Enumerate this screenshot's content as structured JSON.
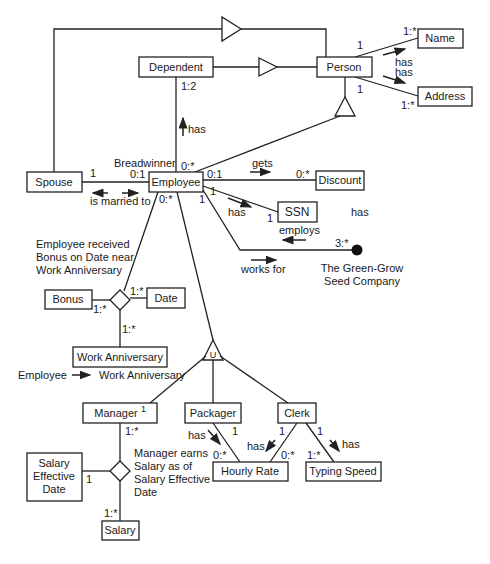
{
  "diagram": {
    "type": "entity-relationship / class diagram",
    "entities": {
      "spouse": "Spouse",
      "employee": "Employee",
      "dependent": "Dependent",
      "person": "Person",
      "name": "Name",
      "address": "Address",
      "discount": "Discount",
      "ssn": "SSN",
      "bonus": "Bonus",
      "date": "Date",
      "work_anniversary": "Work Anniversary",
      "manager": "Manager",
      "manager_sup": "1",
      "packager": "Packager",
      "clerk": "Clerk",
      "hourly_rate": "Hourly Rate",
      "typing_speed": "Typing Speed",
      "salary_effective_date": [
        "Salary",
        "Effective",
        "Date"
      ],
      "salary": "Salary"
    },
    "company": [
      "The Green-Grow",
      "Seed  Company"
    ],
    "labels": {
      "has": "has",
      "gets": "gets",
      "employs": "employs",
      "works_for": "works for",
      "is_married_to": "is married to",
      "breadwinner": "Breadwinner",
      "floating_has": "has",
      "bonus_note": [
        "Employee received",
        "Bonus on Date near",
        "Work Anniversary"
      ],
      "manager_note": [
        "Manager earns",
        "Salary as of",
        "Salary Effective",
        "Date"
      ],
      "legend_from": "Employee",
      "legend_to": "Work Anniversary",
      "union_symbol": "U"
    },
    "multiplicities": {
      "person_name_person": "1",
      "person_name_name": "1:*",
      "person_address_person": "1",
      "person_address_address": "1:*",
      "dependent_employee_dep": "1:2",
      "dependent_employee_emp": "0:*",
      "spouse_employee_spouse": "1",
      "spouse_employee_emp": "0:1",
      "employee_discount_emp": "0:1",
      "employee_discount_disc": "0:*",
      "employee_ssn_emp": "1",
      "employee_ssn_ssn": "1",
      "employee_company_emp": "1",
      "employee_company_co": "3:*",
      "employee_bonus_emp": "0:*",
      "bonus_card": "1:*",
      "date_card": "1:*",
      "workann_card": "1:*",
      "manager_card": "1:*",
      "sed_card": "1",
      "salary_card": "1:*",
      "packager_card": "1",
      "packager_rate_card": "0:*",
      "clerk_rate_clerk": "1",
      "clerk_rate_rate": "0:*",
      "clerk_typing_clerk": "1",
      "clerk_typing_typing": "1:*"
    }
  }
}
